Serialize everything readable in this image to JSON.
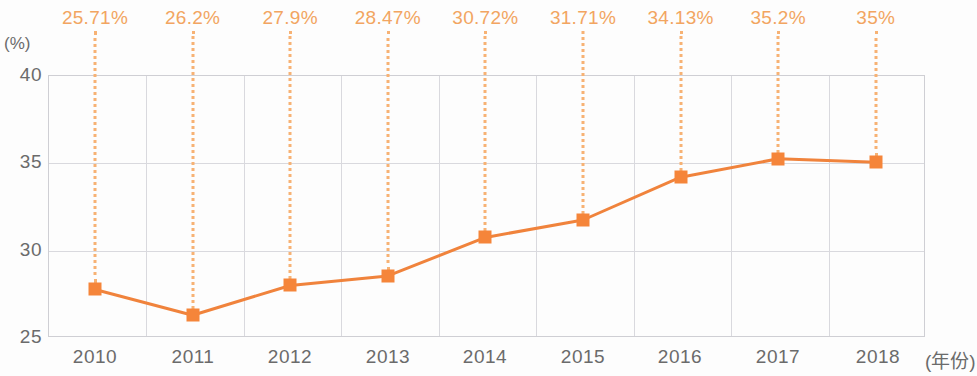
{
  "chart_data": {
    "type": "line",
    "title": "",
    "subtitle": "",
    "xlabel": "(年份)",
    "ylabel": "(%)",
    "categories": [
      "2010",
      "2011",
      "2012",
      "2013",
      "2014",
      "2015",
      "2016",
      "2017",
      "2018"
    ],
    "values": [
      25.71,
      26.2,
      27.9,
      28.47,
      30.72,
      31.71,
      34.13,
      35.2,
      35
    ],
    "data_labels": [
      "25.71%",
      "26.2%",
      "27.9%",
      "28.47%",
      "30.72%",
      "31.71%",
      "34.13%",
      "35.2%",
      "35%"
    ],
    "plotted_values": [
      27.72,
      26.25,
      27.95,
      28.5,
      30.7,
      31.7,
      34.15,
      35.2,
      35.0
    ],
    "ytick_labels": [
      "25",
      "30",
      "35",
      "40"
    ],
    "ytick_values": [
      25,
      30,
      35,
      40
    ],
    "ylim": [
      25,
      40
    ],
    "grid": true,
    "legend": "none",
    "series": [
      {
        "name": "",
        "values": [
          25.71,
          26.2,
          27.9,
          28.47,
          30.72,
          31.71,
          34.13,
          35.2,
          35
        ]
      }
    ],
    "colors": {
      "line": "#f0833c",
      "marker": "#f5853a",
      "data_label": "#f2a561",
      "leader_line": "#f7b274",
      "grid": "#d9d9de",
      "axis": "#cfcfd4",
      "tick_text": "#6b6b6b",
      "background": "#fdfdfd"
    }
  }
}
